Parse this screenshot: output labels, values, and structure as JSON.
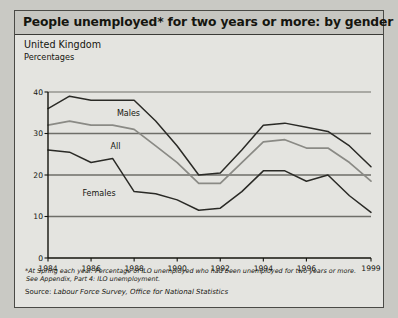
{
  "header": {
    "title": "People unemployed* for two years or more: by gender"
  },
  "subtitle": "United Kingdom",
  "units": "Percentages",
  "footnotes": {
    "line1": "*At Spring each year. Percentage of ILO unemployed who had been unemployed for two years or more.",
    "line2": "See Appendix, Part 4: ILO unemployment."
  },
  "source": {
    "label": "Source: ",
    "text": "Labour Force Survey, Office for National Statistics"
  },
  "colors": {
    "panel_bg": "#e4e4e0",
    "title_bg": "#c6c6c1",
    "outer_bg": "#c9c9c4",
    "border": "#4a4a46",
    "males": "#2a2a26",
    "all": "#8a8a85",
    "females": "#2a2a26",
    "gridline": "#6e6e69"
  },
  "chart_data": {
    "type": "line",
    "title": "People unemployed* for two years or more: by gender",
    "subtitle": "United Kingdom",
    "xlabel": "",
    "ylabel": "Percentages",
    "ylim": [
      0,
      40
    ],
    "yticks": [
      0,
      10,
      20,
      30,
      40
    ],
    "ytick_labels": [
      "0",
      "10",
      "20",
      "30",
      "40"
    ],
    "grid": true,
    "legend_position": "inline-annotations",
    "x": [
      1984,
      1985,
      1986,
      1987,
      1988,
      1989,
      1990,
      1991,
      1992,
      1993,
      1994,
      1995,
      1996,
      1997,
      1998,
      1999
    ],
    "xticks": [
      1984,
      1986,
      1988,
      1990,
      1992,
      1994,
      1996,
      1999
    ],
    "xtick_labels": [
      "1984",
      "1986",
      "1988",
      "1990",
      "1992",
      "1994",
      "1996",
      "1999"
    ],
    "series": [
      {
        "name": "Males",
        "values": [
          36,
          39,
          38,
          38,
          38,
          33,
          27,
          20,
          20.5,
          26,
          32,
          32.5,
          31.5,
          30.5,
          27,
          22
        ]
      },
      {
        "name": "All",
        "values": [
          32,
          33,
          32,
          32,
          31,
          27,
          23,
          18,
          18,
          23,
          28,
          28.5,
          26.5,
          26.5,
          23,
          18.5
        ]
      },
      {
        "name": "Females",
        "values": [
          26,
          25.5,
          23,
          24,
          16,
          15.5,
          14,
          11.5,
          12,
          16,
          21,
          21,
          18.5,
          20,
          15,
          11
        ]
      }
    ]
  }
}
